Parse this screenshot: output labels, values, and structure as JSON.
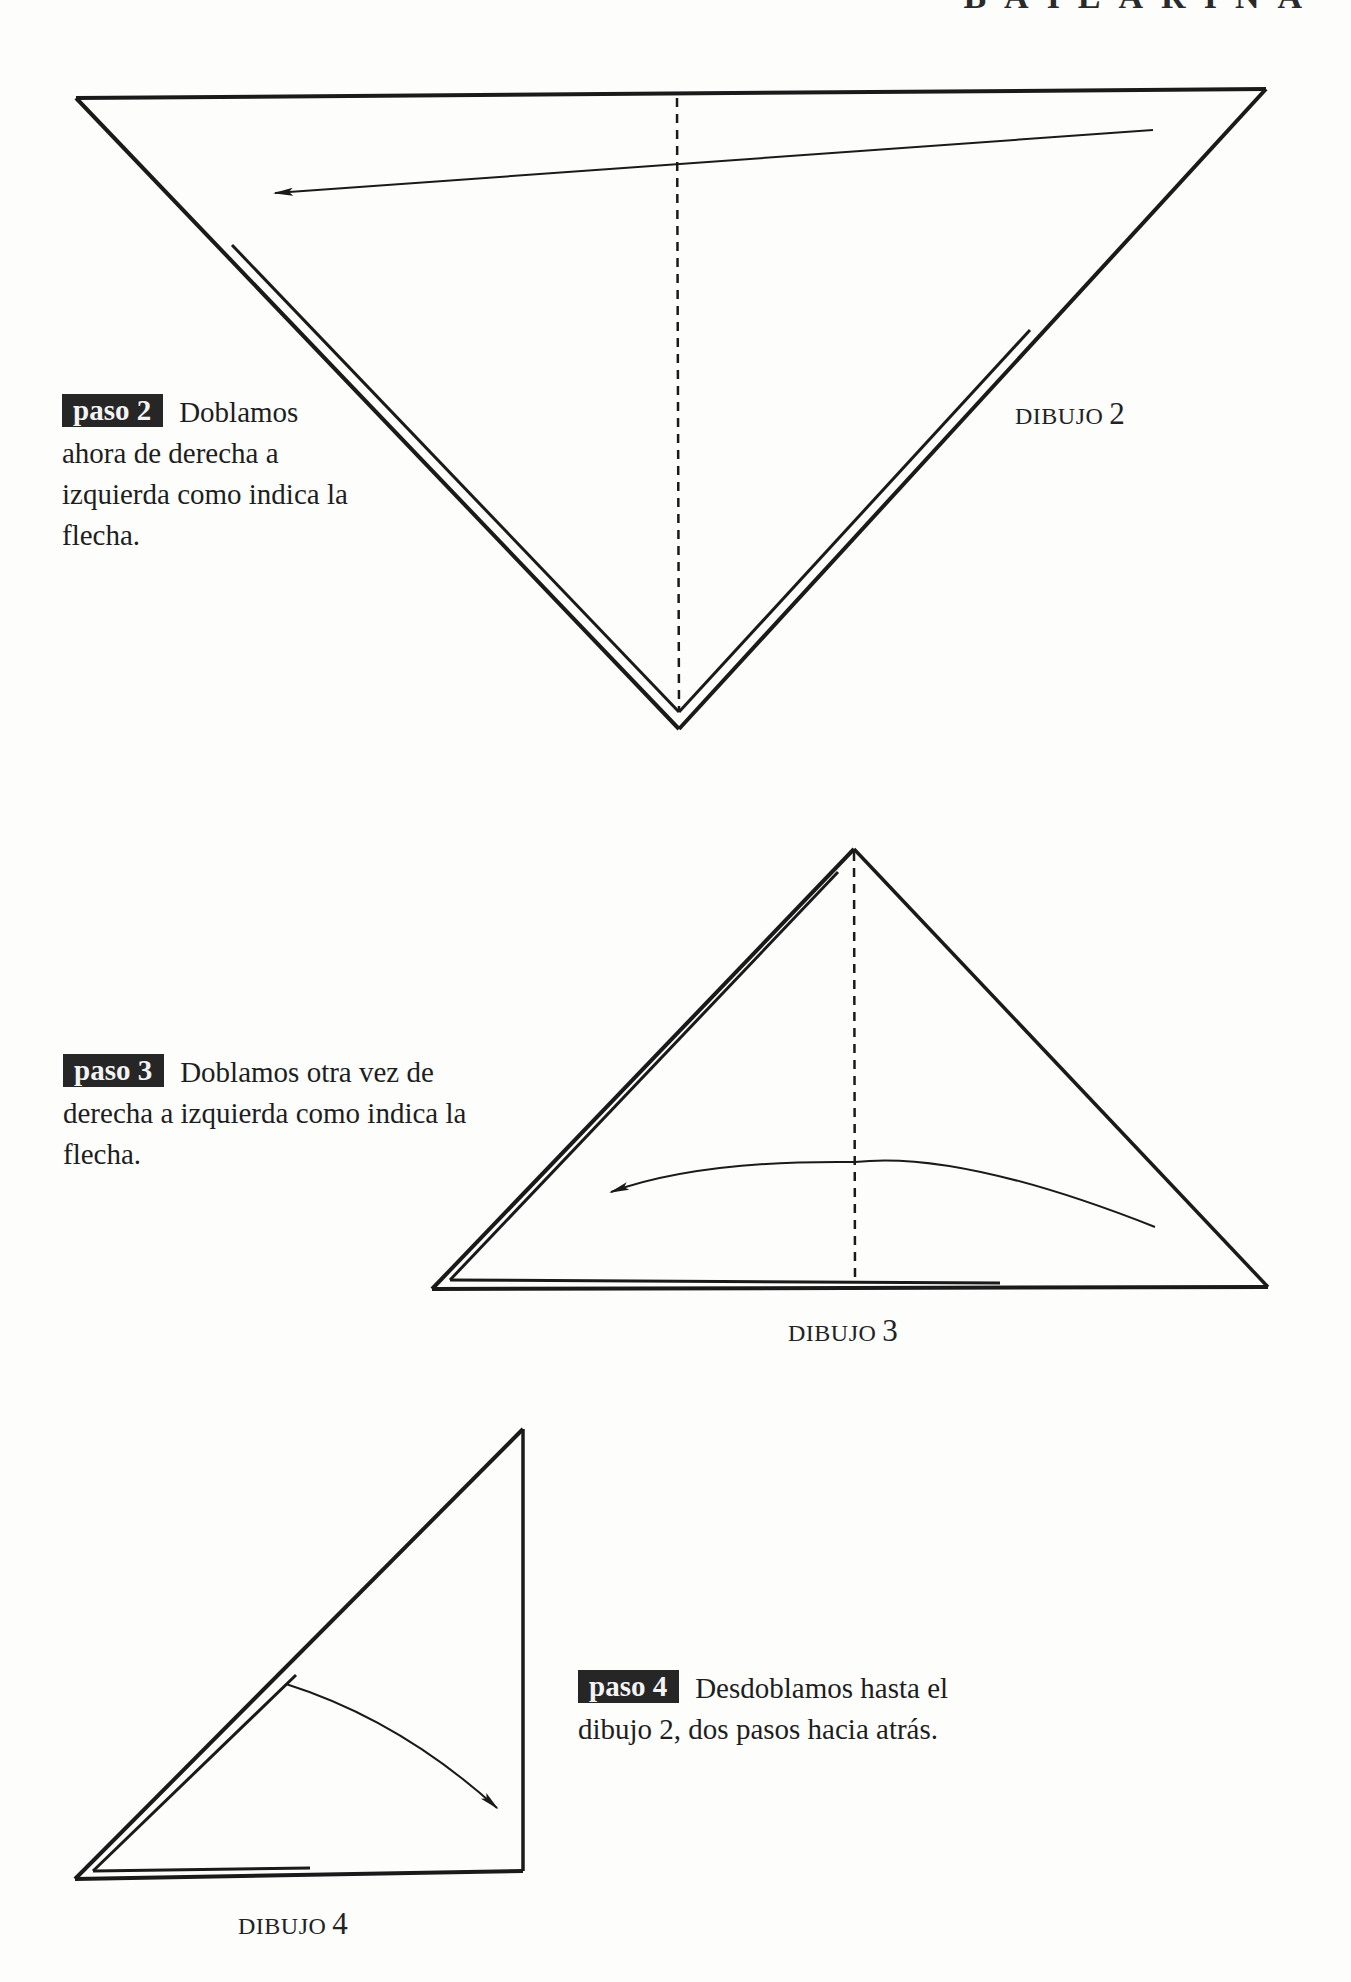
{
  "header": {
    "title": "BAILARINA"
  },
  "steps": [
    {
      "badge": "paso 2",
      "text_first": "Doblamos",
      "text_rest": "ahora de derecha a izquierda como indica la flecha.",
      "lines": [
        "Doblamos",
        "ahora de derecha a",
        "izquierda como indica la",
        "flecha."
      ]
    },
    {
      "badge": "paso 3",
      "lines": [
        "Doblamos otra vez de",
        "derecha a izquierda como indica la",
        "flecha."
      ]
    },
    {
      "badge": "paso 4",
      "lines": [
        "Desdoblamos hasta el",
        "dibujo 2, dos pasos hacia atrás."
      ]
    }
  ],
  "figures": [
    {
      "word": "DIBUJO",
      "number": "2"
    },
    {
      "word": "DIBUJO",
      "number": "3"
    },
    {
      "word": "DIBUJO",
      "number": "4"
    }
  ],
  "colors": {
    "ink": "#1a1a1a",
    "paper": "#fdfdfc",
    "badge_bg": "#262626",
    "badge_text": "#f4f4f4"
  }
}
